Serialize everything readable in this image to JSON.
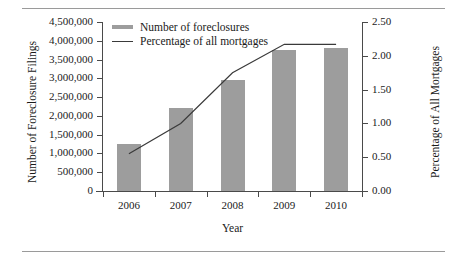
{
  "chart_data": {
    "type": "bar",
    "title": "",
    "categories": [
      "2006",
      "2007",
      "2008",
      "2009",
      "2010"
    ],
    "xlabel": "Year",
    "series": [
      {
        "name": "Number of foreclosures",
        "type": "bar",
        "axis": "left",
        "values": [
          1250000,
          2200000,
          2950000,
          3750000,
          3800000
        ],
        "color": "#9d9d9d"
      },
      {
        "name": "Percentage of all mortgages",
        "type": "line",
        "axis": "right",
        "values": [
          0.55,
          1.0,
          1.75,
          2.17,
          2.17
        ],
        "color": "#3a3a3a"
      }
    ],
    "left_axis": {
      "label": "Number of Foreclosure Filings",
      "ylim": [
        0,
        4500000
      ],
      "ticks": [
        4500000,
        4000000,
        3500000,
        3000000,
        2500000,
        2000000,
        1500000,
        1000000,
        500000,
        0
      ],
      "ticklabels": [
        "4,500,000",
        "4,000,000",
        "3,500,000",
        "3,000,000",
        "2,500,000",
        "2,000,000",
        "1,500,000",
        "1,000,000",
        "500,000",
        "0"
      ]
    },
    "right_axis": {
      "label": "Percentage of All Mortgages",
      "ylim": [
        0,
        2.5
      ],
      "ticks": [
        2.5,
        2.0,
        1.5,
        1.0,
        0.5,
        0.0
      ],
      "ticklabels": [
        "2.50",
        "2.00",
        "1.50",
        "1.00",
        "0.50",
        "0.00"
      ]
    },
    "grid": false,
    "legend_position": "top-left"
  },
  "legend": {
    "items": [
      {
        "label": "Number of foreclosures",
        "marker": "bar-swatch"
      },
      {
        "label": "Percentage of all mortgages",
        "marker": "line-swatch"
      }
    ]
  }
}
